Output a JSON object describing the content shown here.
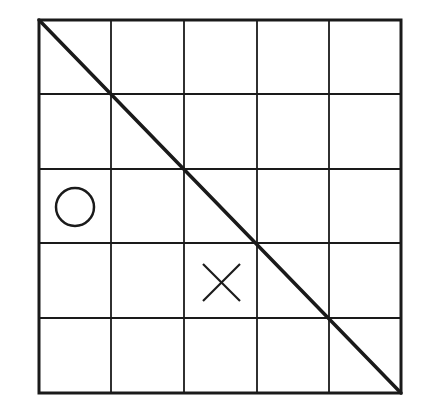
{
  "board": {
    "rows": 5,
    "cols": 5,
    "x_lines": [
      39,
      111,
      184,
      257,
      329,
      401
    ],
    "y_lines": [
      20,
      94,
      169,
      243,
      318,
      393
    ],
    "line_color": "#1a1a1a",
    "background": "#ffffff"
  },
  "diagonal": {
    "from": [
      39,
      20
    ],
    "to": [
      401,
      393
    ]
  },
  "marks": [
    {
      "type": "O",
      "row": 2,
      "col": 0,
      "cx": 75,
      "cy": 207,
      "r": 19
    },
    {
      "type": "X",
      "row": 3,
      "col": 2,
      "x1": 203,
      "y1": 264,
      "x2": 240,
      "y2": 301
    }
  ]
}
